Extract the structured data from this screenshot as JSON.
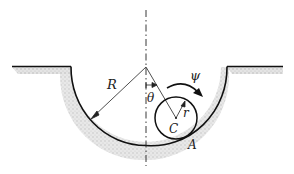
{
  "diagram": {
    "type": "mechanics-figure",
    "labels": {
      "big_radius": "R",
      "small_radius": "r",
      "angle": "θ",
      "spin": "ψ",
      "center": "C",
      "contact_point": "A"
    },
    "colors": {
      "line": "#111111",
      "ground_hatch": "#c8c8c8",
      "background": "#ffffff"
    },
    "geometry": {
      "groove_center": [
        146,
        67
      ],
      "groove_radius": 75,
      "disk_center": [
        176,
        118
      ],
      "disk_radius": 21,
      "ground_level_y": 66
    }
  }
}
